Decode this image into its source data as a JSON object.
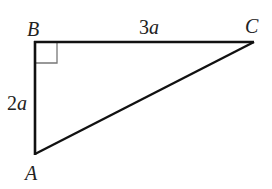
{
  "diagram": {
    "type": "right-triangle",
    "vertices": [
      {
        "id": "A",
        "label": "A",
        "x": 35,
        "y": 154
      },
      {
        "id": "B",
        "label": "B",
        "x": 35,
        "y": 42
      },
      {
        "id": "C",
        "label": "C",
        "x": 253,
        "y": 42
      }
    ],
    "right_angle_at": "B",
    "sides": [
      {
        "from": "B",
        "to": "C",
        "label_number": "3",
        "label_var": "a"
      },
      {
        "from": "B",
        "to": "A",
        "label_number": "2",
        "label_var": "a"
      },
      {
        "from": "A",
        "to": "C",
        "label_number": "",
        "label_var": ""
      }
    ],
    "colors": {
      "stroke": "#111111",
      "right_angle_mark": "#777777",
      "text": "#222222"
    }
  }
}
